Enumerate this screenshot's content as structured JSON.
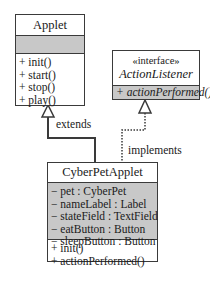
{
  "diagram": {
    "type": "UML class diagram",
    "classes": {
      "applet": {
        "name": "Applet",
        "attributes": [],
        "methods": [
          "+ init()",
          "+ start()",
          "+ stop()",
          "+ play()"
        ]
      },
      "action_listener": {
        "stereotype": "«interface»",
        "name": "ActionListener",
        "methods": [
          "+ actionPerformed()"
        ]
      },
      "cyber_pet_applet": {
        "name": "CyberPetApplet",
        "attributes": [
          "− pet : CyberPet",
          "− nameLabel : Label",
          "− stateField : TextField",
          "− eatButton : Button",
          "− sleepButton : Button"
        ],
        "methods": [
          "+ init()",
          "+ actionPerformed()"
        ]
      }
    },
    "relations": {
      "extends": {
        "label": "extends",
        "from": "CyberPetApplet",
        "to": "Applet",
        "style": "solid"
      },
      "implements": {
        "label": "implements",
        "from": "CyberPetApplet",
        "to": "ActionListener",
        "style": "dotted"
      }
    },
    "colors": {
      "border": "#3a3a3a",
      "compartment_fill": "#c8c8c8",
      "background": "#ffffff"
    }
  }
}
